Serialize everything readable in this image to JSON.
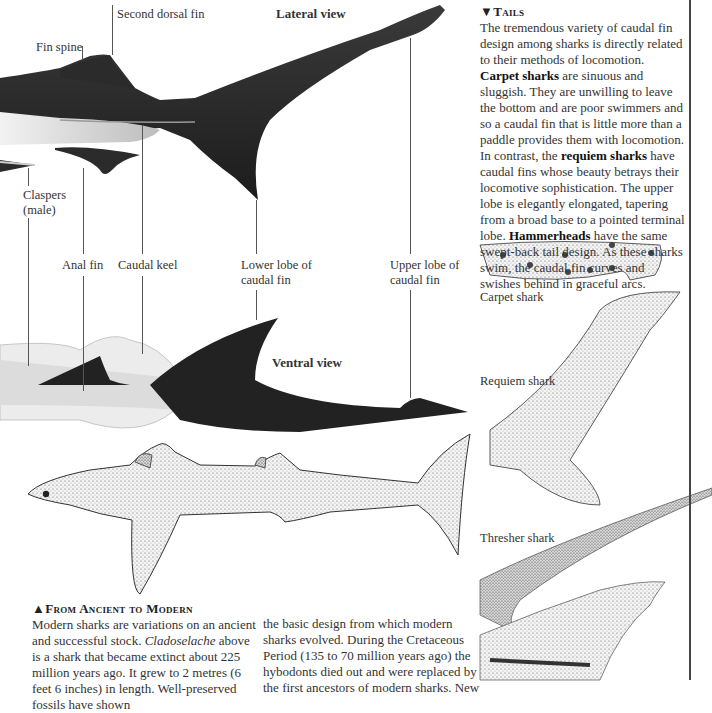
{
  "diagram": {
    "lateral_view_title": "Lateral view",
    "ventral_view_title": "Ventral view",
    "labels": {
      "second_dorsal_fin": "Second dorsal fin",
      "fin_spine": "Fin spine",
      "claspers_line1": "Claspers",
      "claspers_line2": "(male)",
      "anal_fin": "Anal fin",
      "caudal_keel": "Caudal keel",
      "lower_lobe_line1": "Lower lobe of",
      "lower_lobe_line2": "caudal fin",
      "upper_lobe_line1": "Upper lobe of",
      "upper_lobe_line2": "caudal fin"
    }
  },
  "tails_box": {
    "marker": "▼",
    "heading": "Tails",
    "p1": "The tremendous variety of caudal fin design among sharks is directly related to their methods of locomotion. ",
    "b1": "Carpet sharks",
    "p2": " are sinuous and sluggish. They are unwilling to leave the bottom and are poor swimmers and so a caudal fin that is little more than a paddle provides them with locomotion. In contrast, the ",
    "b2": "requiem sharks",
    "p3": " have caudal fins whose beauty betrays their locomotive sophistication. The upper lobe is elegantly elongated, tapering from a broad base to a pointed terminal lobe. ",
    "b3": "Hammerheads",
    "p4": " have the same swept-back tail design. As these sharks swim, the caudal fin curves and swishes behind in graceful arcs."
  },
  "tail_examples": [
    {
      "label": "Carpet shark"
    },
    {
      "label": "Requiem shark"
    },
    {
      "label": "Thresher shark"
    }
  ],
  "ancient_box": {
    "marker": "▲",
    "heading": "From Ancient to Modern",
    "p1": "Modern sharks are variations on an ancient and successful stock. ",
    "italic": "Cladoselache",
    "p2": " above is a shark that became extinct about 225 million years ago. It grew to 2 metres (6 feet 6 inches) in length. Well-preserved fossils have shown",
    "col2": "the basic design from which modern sharks evolved. During the Cretaceous Period (135 to 70 million years ago) the hybodonts died out and were replaced by the first ancestors of modern sharks. New"
  },
  "colors": {
    "shark_dark": "#232323",
    "shark_light": "#e6e6e6",
    "text": "#333333",
    "rule": "#444444"
  }
}
